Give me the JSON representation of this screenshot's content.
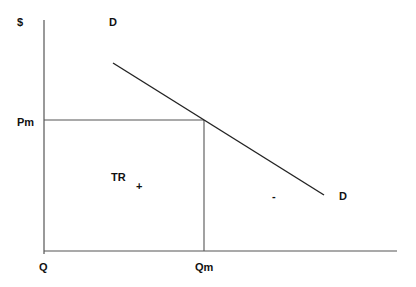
{
  "diagram": {
    "type": "economics-monopoly-demand",
    "labels": {
      "y_axis": "$",
      "origin": "Q",
      "price_level": "Pm",
      "quantity_level": "Qm",
      "demand_top": "D",
      "demand_end": "D",
      "total_revenue": "TR",
      "plus_sign": "+",
      "minus_sign": "-"
    },
    "geometry": {
      "y_axis": {
        "x": 44,
        "y1": 20,
        "y2": 254
      },
      "x_axis": {
        "y": 251,
        "x1": 44,
        "x2": 397
      },
      "price_line": {
        "y": 120,
        "x1": 44,
        "x2": 204
      },
      "quantity_line": {
        "x": 204,
        "y1": 120,
        "y2": 251
      },
      "demand_curve": {
        "x1": 113,
        "y1": 63,
        "x2": 324,
        "y2": 195
      }
    },
    "colors": {
      "line": "#222222",
      "axis": "#555555",
      "text": "#111111",
      "background": "#ffffff"
    }
  }
}
